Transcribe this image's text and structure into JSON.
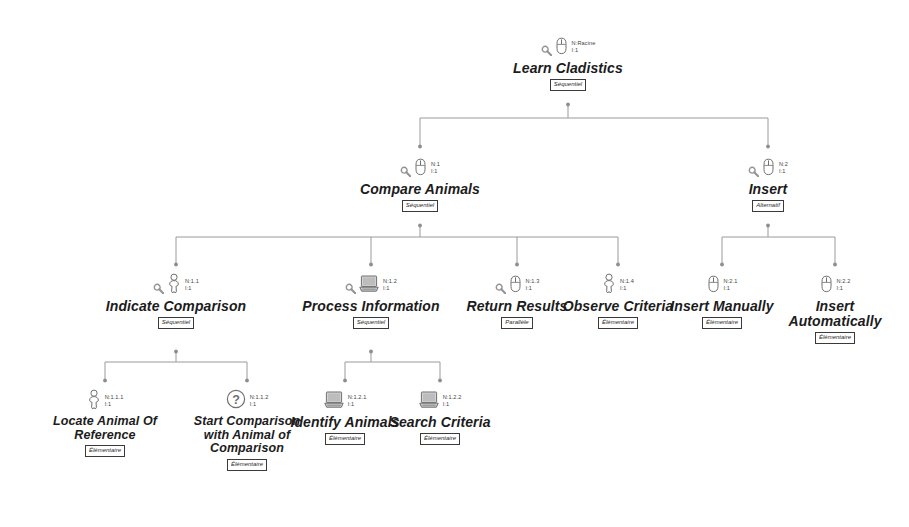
{
  "diagram": {
    "notation": "MAD task tree",
    "line_color": "#9a9a9a",
    "text_color": "#1c1c1c",
    "icon_color": "#6f6f6f",
    "number_prefix": "N:",
    "iteration_prefix": "I:"
  },
  "icons": {
    "magnifier": "magnifier-icon",
    "mouse": "mouse-icon",
    "user": "user-icon",
    "computer": "computer-icon",
    "question": "question-icon"
  },
  "nodes": [
    {
      "id": "root",
      "label": "Learn Cladistics",
      "number": "N:Racine",
      "iteration": "I:1",
      "tag": "Séquentiel",
      "icon": "mouse",
      "magnifier": true,
      "x": 568,
      "y": 34
    },
    {
      "id": "compare-animals",
      "label": "Compare Animals",
      "number": "N:1",
      "iteration": "I:1",
      "tag": "Séquentiel",
      "icon": "mouse",
      "magnifier": true,
      "x": 420,
      "y": 155
    },
    {
      "id": "insert",
      "label": "Insert",
      "number": "N:2",
      "iteration": "I:1",
      "tag": "Alternatif",
      "icon": "mouse",
      "magnifier": true,
      "x": 768,
      "y": 155
    },
    {
      "id": "indicate-comparison",
      "label": "Indicate Comparison",
      "number": "N:1.1",
      "iteration": "I:1",
      "tag": "Séquentiel",
      "icon": "user",
      "magnifier": true,
      "x": 176,
      "y": 272
    },
    {
      "id": "process-information",
      "label": "Process Information",
      "number": "N:1.2",
      "iteration": "I:1",
      "tag": "Séquentiel",
      "icon": "computer",
      "magnifier": true,
      "x": 371,
      "y": 272
    },
    {
      "id": "return-results",
      "label": "Return Results",
      "number": "N:1.3",
      "iteration": "I:1",
      "tag": "Parallèle",
      "icon": "mouse",
      "magnifier": true,
      "x": 517,
      "y": 272
    },
    {
      "id": "observe-criteria",
      "label": "Observe Criteria",
      "number": "N:1.4",
      "iteration": "I:1",
      "tag": "Élémentaire",
      "icon": "user",
      "magnifier": false,
      "x": 618,
      "y": 272
    },
    {
      "id": "insert-manually",
      "label": "Insert Manually",
      "number": "N:2.1",
      "iteration": "I:1",
      "tag": "Élémentaire",
      "icon": "mouse",
      "magnifier": false,
      "x": 722,
      "y": 272
    },
    {
      "id": "insert-automatically",
      "label": "Insert Automatically",
      "number": "N:2.2",
      "iteration": "I:1",
      "tag": "Élémentaire",
      "icon": "mouse",
      "magnifier": false,
      "x": 835,
      "y": 272
    },
    {
      "id": "locate-animal-of-reference",
      "label": "Locate Animal Of Reference",
      "number": "N:1.1.1",
      "iteration": "I:1",
      "tag": "Élémentaire",
      "icon": "user",
      "magnifier": false,
      "x": 105,
      "y": 388
    },
    {
      "id": "start-comparison",
      "label": "Start Comparison with Animal of Comparison",
      "number": "N:1.1.2",
      "iteration": "I:1",
      "tag": "Élémentaire",
      "icon": "question",
      "magnifier": false,
      "x": 247,
      "y": 388
    },
    {
      "id": "identify-animals",
      "label": "Identify Animals",
      "number": "N:1.2.1",
      "iteration": "I:1",
      "tag": "Élémentaire",
      "icon": "computer",
      "magnifier": false,
      "x": 345,
      "y": 388
    },
    {
      "id": "search-criteria",
      "label": "Search Criteria",
      "number": "N:1.2.2",
      "iteration": "I:1",
      "tag": "Élémentaire",
      "icon": "computer",
      "magnifier": false,
      "x": 440,
      "y": 388
    }
  ]
}
